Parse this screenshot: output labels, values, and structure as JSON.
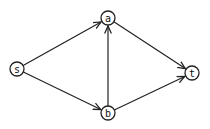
{
  "diagram": {
    "type": "directed-graph",
    "nodes": [
      {
        "id": "s",
        "label": "s",
        "x": 17,
        "y": 69
      },
      {
        "id": "a",
        "label": "a",
        "x": 108,
        "y": 18
      },
      {
        "id": "b",
        "label": "b",
        "x": 108,
        "y": 113
      },
      {
        "id": "t",
        "label": "t",
        "x": 192,
        "y": 73
      }
    ],
    "edges": [
      {
        "from": "s",
        "to": "a"
      },
      {
        "from": "s",
        "to": "b"
      },
      {
        "from": "b",
        "to": "a"
      },
      {
        "from": "a",
        "to": "t"
      },
      {
        "from": "b",
        "to": "t"
      }
    ]
  }
}
